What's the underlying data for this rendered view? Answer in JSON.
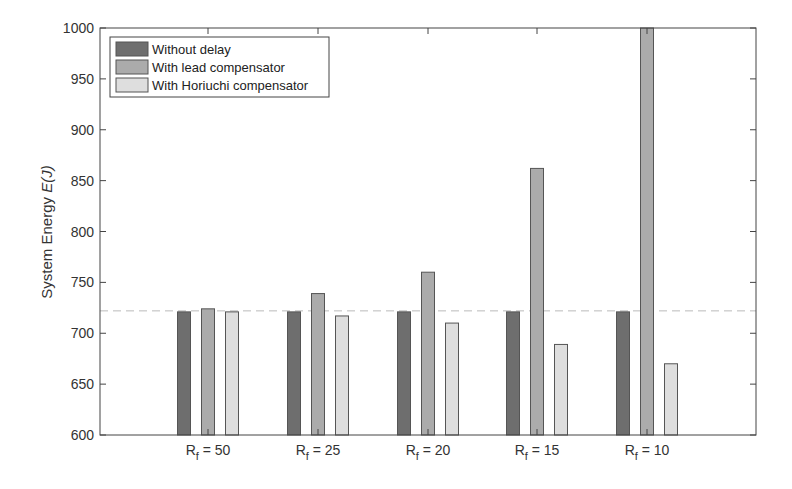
{
  "chart_data": {
    "type": "bar",
    "title": "",
    "xlabel": "",
    "ylabel": "System Energy E(J)",
    "ylabel_plain": "System Energy ",
    "ylabel_italic": "E(J)",
    "ylim": [
      600,
      1000
    ],
    "yticks": [
      600,
      650,
      700,
      750,
      800,
      850,
      900,
      950,
      1000
    ],
    "categories": [
      "R_f = 50",
      "R_f = 25",
      "R_f = 20",
      "R_f = 15",
      "R_f = 10"
    ],
    "category_parts": [
      {
        "main": "R",
        "sub": "f",
        "rest": " = 50"
      },
      {
        "main": "R",
        "sub": "f",
        "rest": " = 25"
      },
      {
        "main": "R",
        "sub": "f",
        "rest": " = 20"
      },
      {
        "main": "R",
        "sub": "f",
        "rest": " = 15"
      },
      {
        "main": "R",
        "sub": "f",
        "rest": " = 10"
      }
    ],
    "series": [
      {
        "name": "Without delay",
        "color": "#6e6e6e",
        "values": [
          721,
          721,
          721,
          721,
          721
        ]
      },
      {
        "name": "With lead compensator",
        "color": "#ababab",
        "values": [
          724,
          739,
          760,
          862,
          1000
        ]
      },
      {
        "name": "With Horiuchi compensator",
        "color": "#dedede",
        "values": [
          721,
          717,
          710,
          689,
          670
        ]
      }
    ],
    "reference_line": {
      "value": 722,
      "style": "dashed",
      "color": "#bbbbbb"
    },
    "legend_position": "upper-left",
    "grid": false
  }
}
